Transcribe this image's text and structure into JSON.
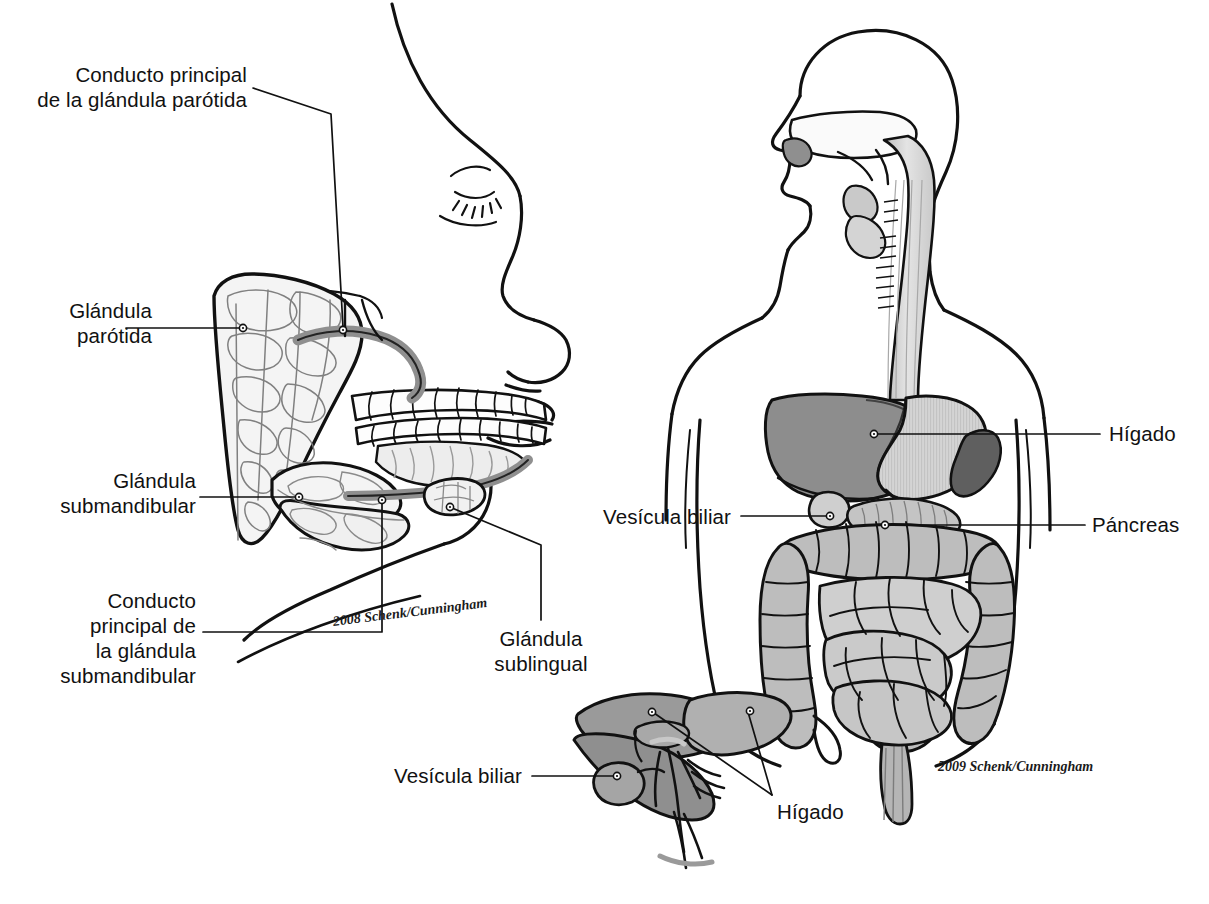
{
  "figure": {
    "title_visible": false,
    "language": "es",
    "background_color": "#ffffff",
    "ink_color": "#111111"
  },
  "palette": {
    "ink": "#111111",
    "leader_line": "#111111",
    "duct_fill": "#8f8f8f",
    "gland_fill": "#f2f2f2",
    "liver_dark": "#8d8d8d",
    "liver_mid": "#a3a3a3",
    "liver_light": "#b8b8b8",
    "stomach_fill": "#d8d8d8",
    "spleen_fill": "#6a6a6a",
    "colon_fill": "#bdbdbd",
    "small_intestine_fill": "#cfcfcf",
    "pancreas_fill": "#c9c9c9",
    "esophagus_fill": "#d5d5d5",
    "body_outline": "#111111",
    "dot_fill": "#ffffff"
  },
  "panels": [
    {
      "id": "head",
      "name": "Glándulas salivales (cabeza, perfil)"
    },
    {
      "id": "torso",
      "name": "Tracto digestivo (torso)"
    },
    {
      "id": "liver",
      "name": "Hígado y vesícula biliar (detalle)"
    }
  ],
  "labels": [
    {
      "id": "conducto-parotida",
      "text_lines": [
        "Conducto principal",
        "de la glándula parótida"
      ],
      "panel": "head",
      "align": "right",
      "text_x": 247,
      "text_y": 62,
      "leader_points": [
        [
          253,
          88
        ],
        [
          331,
          114
        ],
        [
          343,
          327
        ]
      ],
      "dot": [
        343,
        330
      ]
    },
    {
      "id": "glandula-parotida",
      "text_lines": [
        "Glándula",
        "parótida"
      ],
      "panel": "head",
      "align": "right",
      "text_x": 152,
      "text_y": 298,
      "leader_points": [
        [
          126,
          328
        ],
        [
          240,
          328
        ]
      ],
      "dot": [
        243,
        328
      ]
    },
    {
      "id": "glandula-submandibular",
      "text_lines": [
        "Glándula",
        "submandibular"
      ],
      "panel": "head",
      "align": "right",
      "text_x": 196,
      "text_y": 468,
      "leader_points": [
        [
          200,
          497
        ],
        [
          296,
          497
        ]
      ],
      "dot": [
        299,
        497
      ]
    },
    {
      "id": "conducto-submandibular",
      "text_lines": [
        "Conducto",
        "principal de",
        "la glándula",
        "submandibular"
      ],
      "panel": "head",
      "align": "right",
      "text_x": 196,
      "text_y": 588,
      "leader_points": [
        [
          203,
          632
        ],
        [
          382,
          632
        ],
        [
          382,
          502
        ]
      ],
      "dot": [
        382,
        500
      ]
    },
    {
      "id": "glandula-sublingual",
      "text_lines": [
        "Glándula",
        "sublingual"
      ],
      "panel": "head",
      "align": "center",
      "text_x": 541,
      "text_y": 626,
      "leader_points": [
        [
          541,
          620
        ],
        [
          541,
          545
        ],
        [
          452,
          508
        ]
      ],
      "dot": [
        450,
        507
      ]
    },
    {
      "id": "higado-torso",
      "text_lines": [
        "Hígado"
      ],
      "panel": "torso",
      "align": "left",
      "text_x": 1109,
      "text_y": 421,
      "leader_points": [
        [
          1100,
          434
        ],
        [
          877,
          434
        ]
      ],
      "dot": [
        874,
        434
      ]
    },
    {
      "id": "vesicula-torso",
      "text_lines": [
        "Vesícula biliar"
      ],
      "panel": "torso",
      "align": "right",
      "text_x": 731,
      "text_y": 504,
      "leader_points": [
        [
          741,
          516
        ],
        [
          827,
          516
        ]
      ],
      "dot": [
        830,
        516
      ]
    },
    {
      "id": "pancreas-torso",
      "text_lines": [
        "Páncreas"
      ],
      "panel": "torso",
      "align": "left",
      "text_x": 1092,
      "text_y": 512,
      "leader_points": [
        [
          1085,
          525
        ],
        [
          888,
          525
        ]
      ],
      "dot": [
        885,
        525
      ]
    },
    {
      "id": "vesicula-liver",
      "text_lines": [
        "Vesícula biliar"
      ],
      "panel": "liver",
      "align": "right",
      "text_x": 522,
      "text_y": 763,
      "leader_points": [
        [
          532,
          776
        ],
        [
          614,
          776
        ]
      ],
      "dot": [
        617,
        776
      ]
    },
    {
      "id": "higado-liver",
      "text_lines": [
        "Hígado"
      ],
      "panel": "liver",
      "align": "left",
      "text_x": 777,
      "text_y": 799,
      "leader_points": [
        [
          772,
          795
        ],
        [
          654,
          713
        ]
      ],
      "leader_points_2": [
        [
          772,
          795
        ],
        [
          748,
          712
        ]
      ],
      "dot": [
        652,
        712
      ],
      "dot2": [
        750,
        711
      ]
    }
  ],
  "signatures": [
    {
      "id": "sig-head",
      "text": "2008 Schenk/Cunningham",
      "x": 332,
      "y": 614,
      "rotate": -7
    },
    {
      "id": "sig-torso",
      "text": "2009 Schenk/Cunningham",
      "x": 938,
      "y": 759,
      "rotate": 0
    }
  ],
  "anatomy_terms": {
    "head_panel": [
      "Conducto principal de la glándula parótida",
      "Glándula parótida",
      "Glándula submandibular",
      "Conducto principal de la glándula submandibular",
      "Glándula sublingual"
    ],
    "torso_panel": [
      "Hígado",
      "Vesícula biliar",
      "Páncreas"
    ],
    "liver_panel": [
      "Vesícula biliar",
      "Hígado"
    ]
  }
}
